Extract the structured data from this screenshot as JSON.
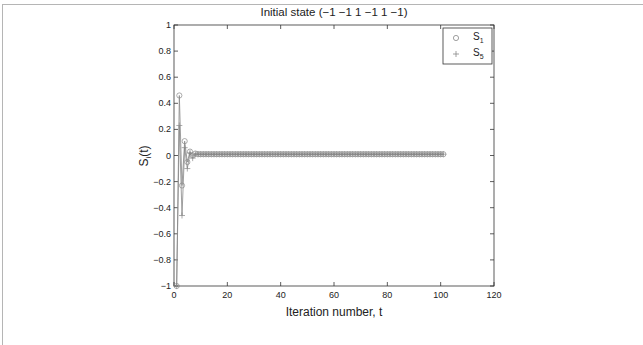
{
  "chart_data": {
    "type": "line",
    "title": "Initial state (−1 −1 1 −1 1 −1)",
    "xlabel": "Iteration number, t",
    "ylabel": "S_i(t)",
    "xlim": [
      0,
      120
    ],
    "ylim": [
      -1,
      1
    ],
    "xticks": [
      0,
      20,
      40,
      60,
      80,
      100,
      120
    ],
    "yticks": [
      -1,
      -0.8,
      -0.6,
      -0.4,
      -0.2,
      0,
      0.2,
      0.4,
      0.6,
      0.8,
      1
    ],
    "xtick_labels": [
      "0",
      "20",
      "40",
      "60",
      "80",
      "100",
      "120"
    ],
    "ytick_labels": [
      "−1",
      "−0.8",
      "−0.6",
      "−0.4",
      "−0.2",
      "0",
      "0.2",
      "0.4",
      "0.6",
      "0.8",
      "1"
    ],
    "grid": false,
    "legend_position": "upper right",
    "series": [
      {
        "name": "S1",
        "marker": "circle",
        "color": "#888888",
        "head_values": [
          -1,
          0.46,
          -0.23,
          0.11,
          -0.05,
          0.03,
          0.0,
          0.015
        ],
        "steady_value": 0.01,
        "t_start": 1,
        "t_end": 101
      },
      {
        "name": "S5",
        "marker": "plus",
        "color": "#888888",
        "head_values": [
          -1,
          0.23,
          -0.46,
          0.06,
          -0.1,
          0.02,
          -0.02,
          0.01
        ],
        "steady_value": 0.01,
        "t_start": 1,
        "t_end": 101
      }
    ]
  },
  "legend": {
    "items": [
      {
        "main": "S",
        "sub": "1",
        "marker": "circle"
      },
      {
        "main": "S",
        "sub": "5",
        "marker": "plus"
      }
    ]
  },
  "labels": {
    "title": "Initial state (−1 −1 1 −1 1 −1)",
    "xlabel": "Iteration number, t",
    "ylabel_main": "S",
    "ylabel_sub": "i",
    "ylabel_tail": "(t)"
  }
}
